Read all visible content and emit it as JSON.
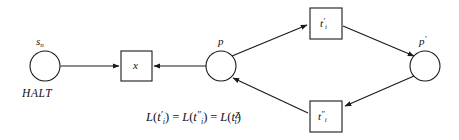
{
  "figure": {
    "type": "petri-net-diagram",
    "background_color": "#ffffff",
    "stroke_color": "#1a1a1a",
    "places": [
      {
        "id": "s_n",
        "label_above": "s",
        "label_above_sub": "n",
        "label_below": "HALT",
        "cx": 45,
        "cy": 66,
        "r": 15
      },
      {
        "id": "p",
        "label_above": "p",
        "cx": 221,
        "cy": 66,
        "r": 15
      },
      {
        "id": "p_prime",
        "label_above": "p",
        "label_above_prime": "′",
        "cx": 425,
        "cy": 66,
        "r": 15
      }
    ],
    "transitions": [
      {
        "id": "x",
        "inner": "x",
        "x": 121,
        "y": 51,
        "w": 31,
        "h": 30
      },
      {
        "id": "t_i_prime",
        "inner": "t",
        "inner_prime": "′",
        "inner_sub": "i",
        "x": 310,
        "y": 8,
        "w": 32,
        "h": 31
      },
      {
        "id": "t_i_double_prime",
        "inner": "t",
        "inner_prime": "″",
        "inner_sub": "i",
        "x": 310,
        "y": 101,
        "w": 32,
        "h": 31
      }
    ],
    "arcs": [
      {
        "id": "arc-sn-to-x",
        "from": "s_n",
        "to": "x",
        "direction": "right"
      },
      {
        "id": "arc-p-to-x",
        "from": "p",
        "to": "x",
        "direction": "left"
      },
      {
        "id": "arc-p-to-tprime",
        "from": "p",
        "to": "t_i_prime",
        "direction": "up-right"
      },
      {
        "id": "arc-tprime-to-pprime",
        "from": "t_i_prime",
        "to": "p_prime",
        "direction": "down-right"
      },
      {
        "id": "arc-pprime-to-tdprime",
        "from": "p_prime",
        "to": "t_i_double_prime",
        "direction": "down-left"
      },
      {
        "id": "arc-tdprime-to-p",
        "from": "t_i_double_prime",
        "to": "p",
        "direction": "up-left"
      }
    ],
    "caption": {
      "text": "L(t′i) = L(t″i) = L(tZi)",
      "terms": [
        {
          "fn": "L",
          "open": "(",
          "base": "t",
          "prime": "′",
          "sub": "i",
          "sup": "",
          "close": ")"
        },
        {
          "fn": "L",
          "open": "(",
          "base": "t",
          "prime": "″",
          "sub": "i",
          "sup": "",
          "close": ")"
        },
        {
          "fn": "L",
          "open": "(",
          "base": "t",
          "prime": "",
          "sub": "i",
          "sup": "Z",
          "close": ")"
        }
      ],
      "equals": "="
    }
  }
}
